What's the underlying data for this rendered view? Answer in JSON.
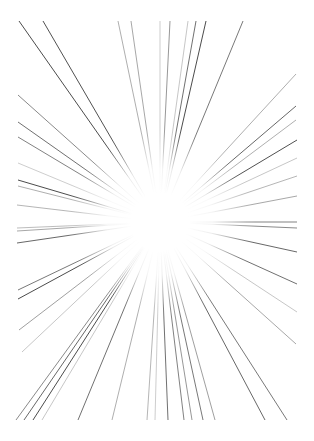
{
  "artwork": {
    "title": "Radial Speed Lines Burst",
    "type": "vector-line-art",
    "canvas": {
      "width": 314,
      "height": 441
    },
    "background_color": "#ffffff",
    "line_color": "#2b2b2b",
    "line_width": 0.8,
    "center": {
      "x": 160,
      "y": 222
    },
    "fade_inner_radius": 38,
    "fade_outer_radius": 96,
    "draw_margin": {
      "left": 17,
      "top": 20,
      "right": 17,
      "bottom": 20
    },
    "ray_count": 52,
    "description": "A white page covered with thin dark radiating straight lines converging toward a blank white void near the center; line density varies and strokes fade to nothing as they approach the middle."
  },
  "chart_data": {
    "type": "line",
    "xlabel": "",
    "ylabel": "",
    "xlim": [
      0,
      314
    ],
    "ylim": [
      0,
      441
    ],
    "grid": false,
    "legend": null,
    "center": [
      160,
      222
    ],
    "rays": [
      {
        "angle_deg": 233.0,
        "outer": [
          19,
          21
        ],
        "opacity": 0.95,
        "width": 0.9
      },
      {
        "angle_deg": 225.6,
        "outer": [
          43,
          21
        ],
        "opacity": 0.92,
        "width": 0.9
      },
      {
        "angle_deg": 264.0,
        "outer": [
          118,
          21
        ],
        "opacity": 0.55,
        "width": 0.7
      },
      {
        "angle_deg": 268.0,
        "outer": [
          131,
          21
        ],
        "opacity": 0.6,
        "width": 0.7
      },
      {
        "angle_deg": 276.0,
        "outer": [
          170,
          21
        ],
        "opacity": 0.7,
        "width": 0.7
      },
      {
        "angle_deg": 285.0,
        "outer": [
          196,
          21
        ],
        "opacity": 0.85,
        "width": 0.8
      },
      {
        "angle_deg": 288.0,
        "outer": [
          206,
          21
        ],
        "opacity": 0.95,
        "width": 0.9
      },
      {
        "angle_deg": 298.0,
        "outer": [
          243,
          21
        ],
        "opacity": 0.8,
        "width": 0.8
      },
      {
        "angle_deg": 219.0,
        "outer": [
          18,
          95
        ],
        "opacity": 0.7,
        "width": 0.8
      },
      {
        "angle_deg": 214.0,
        "outer": [
          18,
          122
        ],
        "opacity": 0.85,
        "width": 0.8
      },
      {
        "angle_deg": 211.0,
        "outer": [
          18,
          137
        ],
        "opacity": 0.75,
        "width": 0.8
      },
      {
        "angle_deg": 202.0,
        "outer": [
          18,
          180
        ],
        "opacity": 0.95,
        "width": 0.9
      },
      {
        "angle_deg": 200.5,
        "outer": [
          18,
          186
        ],
        "opacity": 0.55,
        "width": 0.7
      },
      {
        "angle_deg": 195.0,
        "outer": [
          17,
          205
        ],
        "opacity": 0.5,
        "width": 0.7
      },
      {
        "angle_deg": 181.0,
        "outer": [
          17,
          228
        ],
        "opacity": 0.45,
        "width": 0.7
      },
      {
        "angle_deg": 178.0,
        "outer": [
          17,
          231
        ],
        "opacity": 0.6,
        "width": 0.7
      },
      {
        "angle_deg": 172.0,
        "outer": [
          17,
          243
        ],
        "opacity": 0.9,
        "width": 0.8
      },
      {
        "angle_deg": 158.0,
        "outer": [
          18,
          290
        ],
        "opacity": 0.8,
        "width": 0.8
      },
      {
        "angle_deg": 155.0,
        "outer": [
          18,
          299
        ],
        "opacity": 0.95,
        "width": 0.9
      },
      {
        "angle_deg": 148.0,
        "outer": [
          19,
          330
        ],
        "opacity": 0.65,
        "width": 0.7
      },
      {
        "angle_deg": 127.0,
        "outer": [
          16,
          420
        ],
        "opacity": 0.7,
        "width": 0.8
      },
      {
        "angle_deg": 124.0,
        "outer": [
          24,
          420
        ],
        "opacity": 0.9,
        "width": 0.8
      },
      {
        "angle_deg": 121.0,
        "outer": [
          33,
          420
        ],
        "opacity": 0.95,
        "width": 0.9
      },
      {
        "angle_deg": 112.0,
        "outer": [
          78,
          420
        ],
        "opacity": 0.85,
        "width": 0.8
      },
      {
        "angle_deg": 104.0,
        "outer": [
          112,
          420
        ],
        "opacity": 0.55,
        "width": 0.7
      },
      {
        "angle_deg": 97.0,
        "outer": [
          147,
          420
        ],
        "opacity": 0.5,
        "width": 0.7
      },
      {
        "angle_deg": 92.0,
        "outer": [
          168,
          420
        ],
        "opacity": 0.85,
        "width": 0.8
      },
      {
        "angle_deg": 88.0,
        "outer": [
          184,
          420
        ],
        "opacity": 0.75,
        "width": 0.8
      },
      {
        "angle_deg": 86.0,
        "outer": [
          192,
          420
        ],
        "opacity": 0.7,
        "width": 0.7
      },
      {
        "angle_deg": 83.0,
        "outer": [
          203,
          420
        ],
        "opacity": 0.8,
        "width": 0.8
      },
      {
        "angle_deg": 79.0,
        "outer": [
          215,
          420
        ],
        "opacity": 0.65,
        "width": 0.7
      },
      {
        "angle_deg": 67.0,
        "outer": [
          265,
          420
        ],
        "opacity": 0.9,
        "width": 0.8
      },
      {
        "angle_deg": 326.0,
        "outer": [
          296,
          74
        ],
        "opacity": 0.55,
        "width": 0.7
      },
      {
        "angle_deg": 331.0,
        "outer": [
          296,
          106
        ],
        "opacity": 0.9,
        "width": 0.8
      },
      {
        "angle_deg": 334.0,
        "outer": [
          296,
          120
        ],
        "opacity": 0.55,
        "width": 0.7
      },
      {
        "angle_deg": 338.0,
        "outer": [
          297,
          140
        ],
        "opacity": 0.92,
        "width": 0.9
      },
      {
        "angle_deg": 344.0,
        "outer": [
          297,
          176
        ],
        "opacity": 0.5,
        "width": 0.7
      },
      {
        "angle_deg": 349.0,
        "outer": [
          297,
          196
        ],
        "opacity": 0.6,
        "width": 0.7
      },
      {
        "angle_deg": 357.0,
        "outer": [
          297,
          222
        ],
        "opacity": 0.75,
        "width": 0.8
      },
      {
        "angle_deg": 359.0,
        "outer": [
          297,
          228
        ],
        "opacity": 0.7,
        "width": 0.8
      },
      {
        "angle_deg": 7.0,
        "outer": [
          297,
          252
        ],
        "opacity": 0.9,
        "width": 0.8
      },
      {
        "angle_deg": 14.0,
        "outer": [
          297,
          284
        ],
        "opacity": 0.85,
        "width": 0.8
      },
      {
        "angle_deg": 26.0,
        "outer": [
          296,
          344
        ],
        "opacity": 0.6,
        "width": 0.7
      },
      {
        "angle_deg": 38.0,
        "outer": [
          287,
          420
        ],
        "opacity": 0.8,
        "width": 0.8
      },
      {
        "angle_deg": 282.0,
        "outer": [
          188,
          21
        ],
        "opacity": 0.45,
        "width": 0.6
      },
      {
        "angle_deg": 271.0,
        "outer": [
          160,
          21
        ],
        "opacity": 0.4,
        "width": 0.6
      },
      {
        "angle_deg": 119.0,
        "outer": [
          42,
          420
        ],
        "opacity": 0.45,
        "width": 0.6
      },
      {
        "angle_deg": 144.0,
        "outer": [
          22,
          352
        ],
        "opacity": 0.45,
        "width": 0.6
      },
      {
        "angle_deg": 206.0,
        "outer": [
          18,
          163
        ],
        "opacity": 0.4,
        "width": 0.6
      },
      {
        "angle_deg": 341.0,
        "outer": [
          297,
          158
        ],
        "opacity": 0.45,
        "width": 0.6
      },
      {
        "angle_deg": 20.0,
        "outer": [
          297,
          312
        ],
        "opacity": 0.45,
        "width": 0.6
      },
      {
        "angle_deg": 95.0,
        "outer": [
          155,
          420
        ],
        "opacity": 0.4,
        "width": 0.6
      }
    ]
  }
}
